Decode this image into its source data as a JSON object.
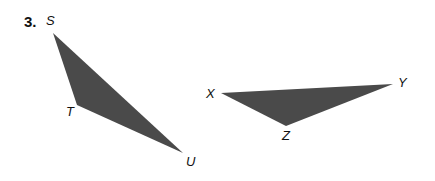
{
  "problem_number": "3.",
  "fill_color": "#4a4a4a",
  "triangles": [
    {
      "name": "STU",
      "vertices": {
        "S": [
          53,
          33
        ],
        "T": [
          77,
          105
        ],
        "U": [
          183,
          153
        ]
      }
    },
    {
      "name": "XYZ",
      "vertices": {
        "X": [
          221,
          93
        ],
        "Y": [
          393,
          84
        ],
        "Z": [
          286,
          126
        ]
      }
    }
  ],
  "labels": {
    "S": "S",
    "T": "T",
    "U": "U",
    "X": "X",
    "Y": "Y",
    "Z": "Z"
  }
}
